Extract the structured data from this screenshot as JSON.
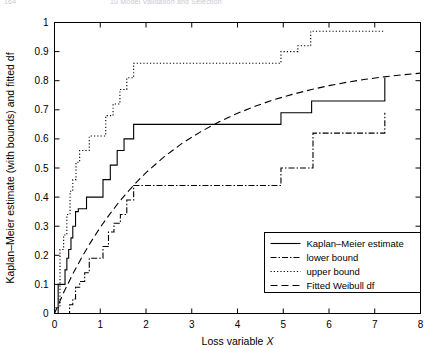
{
  "page_header": {
    "left": "164",
    "right": "10 Model Validation and Selection"
  },
  "chart_data": {
    "type": "line",
    "title": "",
    "xlabel": "Loss variable X",
    "ylabel": "Kaplan-Meier estimate (with bounds) and fitted df",
    "xlim": [
      0,
      8
    ],
    "ylim": [
      0,
      1
    ],
    "xticks": [
      0,
      1,
      2,
      3,
      4,
      5,
      6,
      7,
      8
    ],
    "xticklabels": [
      "0",
      "1",
      "2",
      "3",
      "4",
      "5",
      "6",
      "7",
      "8"
    ],
    "yticks": [
      0,
      0.1,
      0.2,
      0.3,
      0.4,
      0.5,
      0.6,
      0.7,
      0.8,
      0.9,
      1
    ],
    "yticklabels": [
      "0",
      "0.1",
      "0.2",
      "0.3",
      "0.4",
      "0.5",
      "0.6",
      "0.7",
      "0.8",
      "0.9",
      "1"
    ],
    "grid": false,
    "legend_position": "lower right",
    "series": [
      {
        "name": "Kaplan-Meier estimate",
        "style": "solid",
        "dash": "none",
        "shape": "step",
        "x": [
          0.0,
          0.08,
          0.18,
          0.23,
          0.27,
          0.31,
          0.36,
          0.4,
          0.46,
          0.52,
          0.7,
          0.97,
          1.06,
          1.22,
          1.37,
          1.52,
          1.73,
          4.72,
          4.95,
          5.62,
          7.18,
          7.22
        ],
        "y": [
          0.0,
          0.1,
          0.1,
          0.15,
          0.19,
          0.22,
          0.26,
          0.3,
          0.35,
          0.36,
          0.4,
          0.4,
          0.46,
          0.51,
          0.56,
          0.6,
          0.65,
          0.65,
          0.69,
          0.73,
          0.73,
          0.81
        ]
      },
      {
        "name": "lower bound",
        "style": "dash-dot",
        "dash": "6,2,1.5,2",
        "shape": "step",
        "x": [
          0.0,
          0.27,
          0.33,
          0.4,
          0.46,
          0.55,
          0.66,
          0.76,
          0.92,
          1.06,
          1.18,
          1.3,
          1.44,
          1.58,
          1.73,
          4.72,
          4.95,
          5.58,
          5.65,
          7.18,
          7.22
        ],
        "y": [
          0.0,
          0.0,
          0.03,
          0.05,
          0.09,
          0.11,
          0.14,
          0.19,
          0.19,
          0.23,
          0.28,
          0.31,
          0.34,
          0.39,
          0.44,
          0.44,
          0.5,
          0.5,
          0.62,
          0.62,
          0.69
        ]
      },
      {
        "name": "upper bound",
        "style": "dotted",
        "dash": "1.2,2.1",
        "shape": "step",
        "x": [
          0.0,
          0.06,
          0.12,
          0.2,
          0.27,
          0.34,
          0.4,
          0.47,
          0.55,
          0.76,
          1.03,
          1.12,
          1.28,
          1.43,
          1.58,
          1.73,
          4.72,
          4.95,
          5.32,
          5.6,
          7.18,
          7.22
        ],
        "y": [
          0.02,
          0.02,
          0.22,
          0.27,
          0.34,
          0.42,
          0.46,
          0.52,
          0.56,
          0.61,
          0.61,
          0.68,
          0.72,
          0.77,
          0.81,
          0.86,
          0.86,
          0.9,
          0.92,
          0.97,
          0.97,
          0.97
        ]
      },
      {
        "name": "Fitted Weibull df",
        "style": "dashed",
        "dash": "7,4",
        "shape": "smooth",
        "x": [
          0.0,
          0.2,
          0.4,
          0.6,
          0.8,
          1.0,
          1.2,
          1.4,
          1.6,
          1.8,
          2.0,
          2.4,
          2.8,
          3.2,
          3.6,
          4.0,
          4.4,
          4.8,
          5.2,
          5.6,
          6.0,
          6.4,
          6.8,
          7.2,
          7.6,
          8.0
        ],
        "y": [
          0.0,
          0.072,
          0.136,
          0.194,
          0.247,
          0.296,
          0.34,
          0.381,
          0.418,
          0.452,
          0.484,
          0.539,
          0.586,
          0.625,
          0.659,
          0.688,
          0.713,
          0.735,
          0.753,
          0.769,
          0.783,
          0.795,
          0.805,
          0.813,
          0.82,
          0.826
        ]
      }
    ]
  },
  "legend": {
    "entries": [
      {
        "label": "Kaplan-Meier estimate",
        "dash": "none"
      },
      {
        "label": "lower bound",
        "dash": "6,2,1.5,2"
      },
      {
        "label": "upper bound",
        "dash": "1.2,2.1"
      },
      {
        "label": "Fitted Weibull df",
        "dash": "7,4"
      }
    ]
  }
}
